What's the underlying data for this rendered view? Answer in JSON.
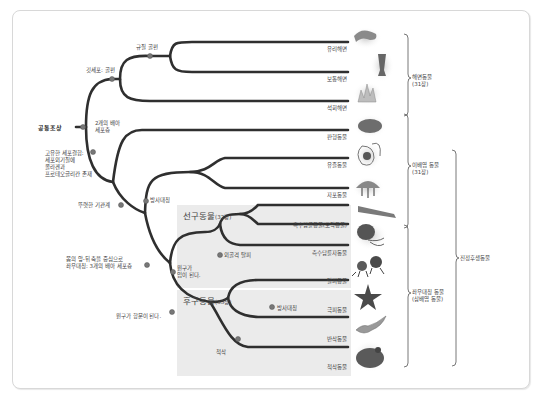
{
  "diagram": {
    "type": "phylogenetic-tree",
    "root": {
      "label": "공통조상",
      "note_left": [
        "고유한 세포결합:",
        "세포외기질에",
        "콜라겐과",
        "프로테오글리칸 존재"
      ]
    },
    "nodes": {
      "true_tissue_no": "깃세포: 골편",
      "spicules": "규질 골편",
      "two_germ": [
        "2개의 배아",
        "세포층"
      ],
      "true_tissue": "뚜렷한 기관계",
      "radial": "방사대칭",
      "bilateral": [
        "몸의 앞-뒤 축을 중심으로",
        "좌우대칭: 3개의 배아 세포층"
      ],
      "blastopore_mouth": [
        "원구가",
        "입이 된다."
      ],
      "molting": "외골격 탈피",
      "blastopore_anus": "원구가 항문이 된다.",
      "notochord": "척삭",
      "radial2": "방사대칭"
    },
    "groups": {
      "protostome": {
        "name": "선구동물",
        "chapter": "(32장)"
      },
      "deuterostome": {
        "name": "후구동물",
        "chapter": "(33장)"
      }
    },
    "taxa": [
      {
        "name": "유리해면",
        "icon": "glass-sponge-icon"
      },
      {
        "name": "보통해면",
        "icon": "demosponge-icon"
      },
      {
        "name": "석회해면",
        "icon": "calcareous-sponge-icon"
      },
      {
        "name": "판형동물",
        "icon": "placozoa-icon"
      },
      {
        "name": "유즐동물",
        "icon": "ctenophore-icon"
      },
      {
        "name": "자포동물",
        "icon": "jellyfish-icon"
      },
      {
        "name": "촉수담륜동물(모악동물)",
        "icon": "lophotrochozoa-worm-icon"
      },
      {
        "name": "촉수담륜자동물",
        "icon": "octopus-icon"
      },
      {
        "name": "탈피동물",
        "icon": "arthropod-icon"
      },
      {
        "name": "극피동물",
        "icon": "starfish-icon"
      },
      {
        "name": "반삭동물",
        "icon": "acorn-worm-icon"
      },
      {
        "name": "척삭동물",
        "icon": "frog-icon"
      }
    ],
    "brackets": [
      {
        "label": [
          "해면동물",
          "(31장)"
        ]
      },
      {
        "label": [
          "이배엽 동물",
          "(31장)"
        ]
      },
      {
        "label": [
          "좌우대칭 동물",
          "(삼배엽 동물)"
        ]
      },
      {
        "label": [
          "진정후생동물"
        ]
      }
    ]
  }
}
